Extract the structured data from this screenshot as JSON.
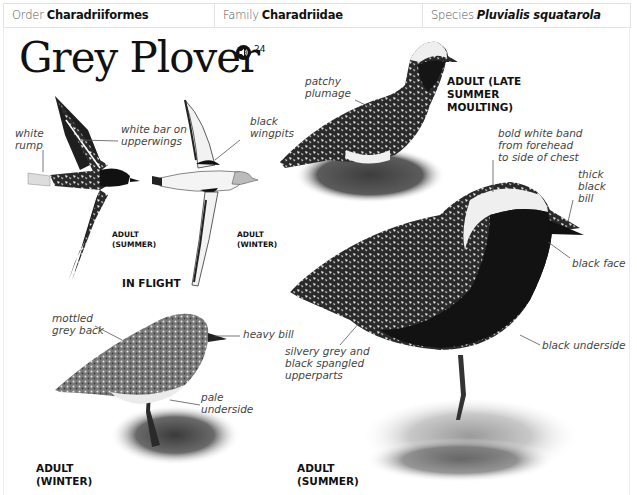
{
  "header": {
    "order": {
      "label": "Order",
      "value": "Charadriiformes"
    },
    "family": {
      "label": "Family",
      "value": "Charadriidae"
    },
    "species": {
      "label": "Species",
      "value": "Pluvialis squatarola"
    }
  },
  "title": "Grey Plover",
  "audio": {
    "icon": "speaker-icon",
    "track_number": "24"
  },
  "flight_section": {
    "heading": "IN FLIGHT",
    "summer_caption": [
      "ADULT",
      "(SUMMER)"
    ],
    "winter_caption": [
      "ADULT",
      "(WINTER)"
    ],
    "annotations": {
      "white_rump": [
        "white",
        "rump"
      ],
      "white_bar": [
        "white bar on",
        "upperwings"
      ],
      "black_wingpits": [
        "black",
        "wingpits"
      ]
    }
  },
  "moulting_section": {
    "caption": [
      "ADULT (LATE",
      "SUMMER",
      "MOULTING)"
    ],
    "annotations": {
      "patchy_plumage": [
        "patchy",
        "plumage"
      ]
    }
  },
  "summer_section": {
    "caption": [
      "ADULT",
      "(SUMMER)"
    ],
    "annotations": {
      "white_band": [
        "bold white band",
        "from forehead",
        "to side of chest"
      ],
      "thick_bill": [
        "thick",
        "black",
        "bill"
      ],
      "black_face": [
        "black face"
      ],
      "spangled": [
        "silvery grey and",
        "black spangled",
        "upperparts"
      ],
      "black_underside": [
        "black underside"
      ]
    }
  },
  "winter_section": {
    "caption": [
      "ADULT",
      "(WINTER)"
    ],
    "annotations": {
      "mottled_back": [
        "mottled",
        "grey back"
      ],
      "heavy_bill": [
        "heavy bill"
      ],
      "pale_underside": [
        "pale",
        "underside"
      ]
    }
  },
  "colors": {
    "ink": "#111111",
    "annotation": "#444444",
    "border": "#e2e2e2"
  }
}
